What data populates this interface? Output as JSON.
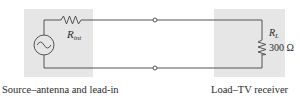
{
  "diagram": {
    "type": "circuit",
    "source": {
      "caption": "Source–antenna and lead-in",
      "resistor_symbol": "R",
      "resistor_subscript": "int",
      "generator": "ac-voltage-source"
    },
    "load": {
      "caption": "Load–TV receiver",
      "resistor_symbol": "R",
      "resistor_subscript": "L",
      "resistor_value": "300 Ω"
    },
    "colors": {
      "box_fill": "#e6e6e6",
      "wire": "#555555",
      "text": "#2a2a2a"
    }
  }
}
